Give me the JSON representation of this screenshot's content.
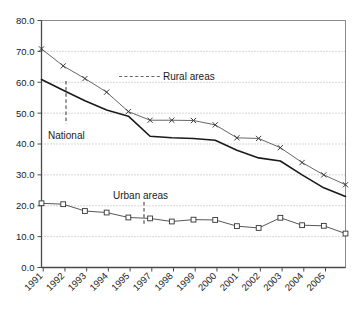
{
  "chart_data": {
    "type": "line",
    "title": "",
    "subtitle": "",
    "xlabel": "",
    "ylabel": "",
    "xlim": [
      1991,
      2005
    ],
    "ylim": [
      0.0,
      80.0
    ],
    "ytick_step": 10.0,
    "grid": "horizontal-dotted",
    "legend": "inline-annotations",
    "x": [
      1991,
      1992,
      1993,
      1994,
      1995,
      1996,
      1997,
      1998,
      1999,
      2000,
      2001,
      2002,
      2003,
      2004,
      2005
    ],
    "xtick_labels": [
      "1991",
      "1992",
      "1993",
      "1994",
      "1995",
      "1997",
      "1998",
      "1999",
      "2000",
      "2001",
      "2002",
      "2003",
      "2004",
      "2005"
    ],
    "ytick_labels": [
      "0.0",
      "10.0",
      "20.0",
      "30.0",
      "40.0",
      "50.0",
      "60.0",
      "70.0",
      "80.0"
    ],
    "series": [
      {
        "name": "Rural areas",
        "marker": "x",
        "color": "#555555",
        "values": [
          70.8,
          65.3,
          61.2,
          56.8,
          50.5,
          47.7,
          47.7,
          47.6,
          46.2,
          42.0,
          41.8,
          38.8,
          34.0,
          30.0,
          26.8
        ]
      },
      {
        "name": "National",
        "marker": "none",
        "color": "#1a1a1a",
        "values": [
          60.9,
          57.4,
          54.0,
          51.0,
          49.0,
          42.5,
          42.0,
          41.8,
          41.2,
          38.0,
          35.5,
          34.5,
          30.0,
          25.8,
          23.0
        ]
      },
      {
        "name": "Urban areas",
        "marker": "square",
        "color": "#444444",
        "values": [
          20.8,
          20.5,
          18.3,
          17.8,
          16.2,
          15.9,
          14.9,
          15.5,
          15.4,
          13.4,
          12.8,
          16.1,
          13.7,
          13.5,
          11.0
        ]
      }
    ],
    "annotations": [
      {
        "text": "Rural areas",
        "leader": "dashed-horizontal",
        "target_series": "Rural areas"
      },
      {
        "text": "National",
        "leader": "dashed-vertical",
        "target_series": "National"
      },
      {
        "text": "Urban areas",
        "leader": "dashed-vertical",
        "target_series": "Urban areas"
      }
    ]
  }
}
